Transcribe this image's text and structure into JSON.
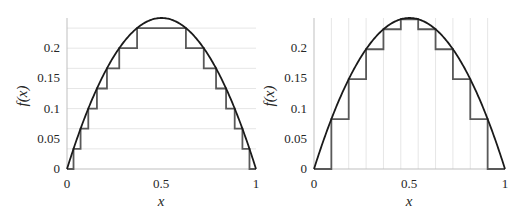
{
  "chart_data": [
    {
      "type": "line",
      "panel": "left",
      "title": "",
      "xlabel": "x",
      "ylabel": "f(x)",
      "xlim": [
        0,
        1
      ],
      "ylim": [
        0,
        0.25
      ],
      "xticks": [
        "0",
        "0.5",
        "1"
      ],
      "yticks": [
        "0",
        "0.05",
        "0.1",
        "0.15",
        "0.2"
      ],
      "grid": "horizontal lines at y = k/30",
      "series": [
        {
          "name": "f(x) = x(1-x)",
          "function": "x*(1-x)",
          "color": "#1a1a1a"
        },
        {
          "name": "staircase (equal y-levels)",
          "color": "#595959",
          "levels": [
            0,
            0.0333,
            0.0667,
            0.1,
            0.1333,
            0.1667,
            0.2,
            0.2333
          ]
        }
      ]
    },
    {
      "type": "line",
      "panel": "right",
      "title": "",
      "xlabel": "x",
      "ylabel": "f(x)",
      "xlim": [
        0,
        1
      ],
      "ylim": [
        0,
        0.25
      ],
      "xticks": [
        "0",
        "0.5",
        "1"
      ],
      "yticks": [
        "0",
        "0.05",
        "0.1",
        "0.15",
        "0.2"
      ],
      "grid": "vertical lines at x = k/11",
      "series": [
        {
          "name": "f(x) = x(1-x)",
          "function": "x*(1-x)",
          "color": "#1a1a1a"
        },
        {
          "name": "staircase (equal x-intervals, n=11)",
          "color": "#595959",
          "x_breaks": [
            0,
            0.0909,
            0.1818,
            0.2727,
            0.3636,
            0.4545,
            0.5455,
            0.6364,
            0.7273,
            0.8182,
            0.9091,
            1
          ],
          "values": [
            0,
            0.0826,
            0.1488,
            0.1983,
            0.2314,
            0.2479,
            0.2314,
            0.1983,
            0.1488,
            0.0826,
            0
          ]
        }
      ]
    }
  ],
  "panels": {
    "left": {
      "xlabel": "x",
      "ylabel": "f(x)",
      "xticks": [
        "0",
        "0.5",
        "1"
      ],
      "yticks": [
        "0",
        "0.05",
        "0.1",
        "0.15",
        "0.2"
      ]
    },
    "right": {
      "xlabel": "x",
      "ylabel": "f(x)",
      "xticks": [
        "0",
        "0.5",
        "1"
      ],
      "yticks": [
        "0",
        "0.05",
        "0.1",
        "0.15",
        "0.2"
      ]
    }
  },
  "colors": {
    "curve": "#1a1a1a",
    "staircase": "#595959",
    "grid": "#e6e6e6",
    "axis": "#bfbfbf"
  }
}
